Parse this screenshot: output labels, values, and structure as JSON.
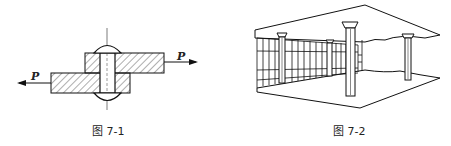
{
  "figures": [
    {
      "caption": "图 7-1",
      "labels": {
        "force_left": "P",
        "force_right": "P"
      },
      "description": "Riveted lap joint cross-section with two overlapping hatched plates and forces P in opposite directions"
    },
    {
      "caption": "图 7-2",
      "description": "Perspective drawing of a building interior with columns supporting a slab and a windowed wall"
    }
  ]
}
